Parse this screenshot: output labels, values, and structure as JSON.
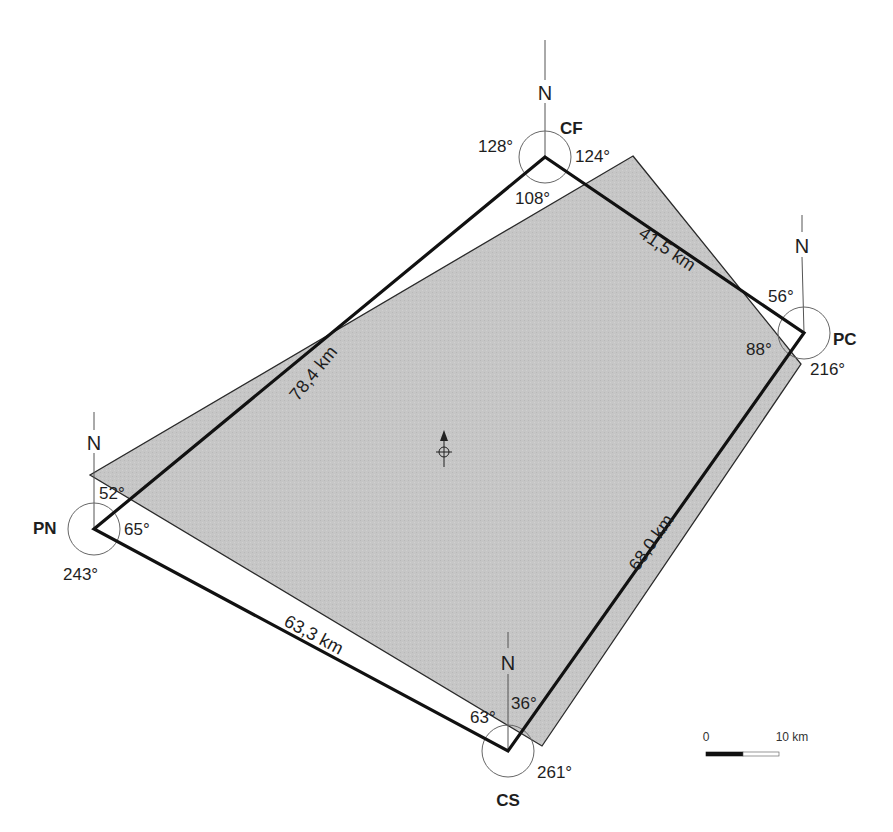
{
  "diagram": {
    "type": "survey-quadrilateral",
    "background_color": "#ffffff",
    "fill_color": "#c4c4c4",
    "outline_color": "#111111",
    "north_label": "N",
    "stations": [
      {
        "id": "CF",
        "label": "CF",
        "x": 545,
        "y": 157,
        "angles": [
          "128°",
          "124°",
          "108°"
        ]
      },
      {
        "id": "PC",
        "label": "PC",
        "x": 804,
        "y": 333,
        "angles": [
          "56°",
          "88°",
          "216°"
        ]
      },
      {
        "id": "CS",
        "label": "CS",
        "x": 508,
        "y": 751,
        "angles": [
          "63°",
          "36°",
          "261°"
        ]
      },
      {
        "id": "PN",
        "label": "PN",
        "x": 94,
        "y": 529,
        "angles": [
          "52°",
          "65°",
          "243°"
        ]
      }
    ],
    "edges": [
      {
        "from": "PN",
        "to": "CF",
        "distance": "78,4 km"
      },
      {
        "from": "CF",
        "to": "PC",
        "distance": "41,5 km"
      },
      {
        "from": "PC",
        "to": "CS",
        "distance": "68,0 km"
      },
      {
        "from": "CS",
        "to": "PN",
        "distance": "63,3 km"
      }
    ],
    "coverage_polygon": [
      [
        633,
        156
      ],
      [
        801,
        364
      ],
      [
        542,
        746
      ],
      [
        90,
        475
      ]
    ],
    "center_marker": {
      "x": 444,
      "y": 452,
      "type": "north-arrow-with-crosshair"
    },
    "scale_bar": {
      "start_label": "0",
      "end_label": "10 km"
    }
  }
}
